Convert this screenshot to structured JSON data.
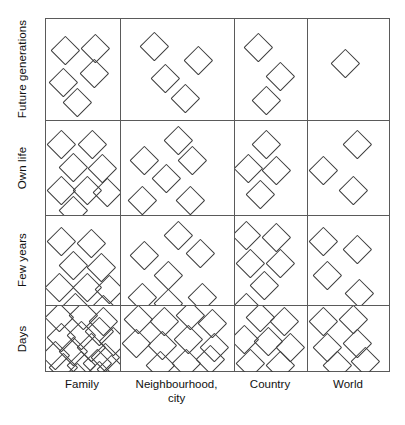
{
  "figure": {
    "type": "matrix-dot-density",
    "row_axis_title": "",
    "col_axis_title": ""
  },
  "rows": [
    {
      "key": "future_generations",
      "label": "Future generations"
    },
    {
      "key": "own_life",
      "label": "Own life"
    },
    {
      "key": "few_years",
      "label": "Few years"
    },
    {
      "key": "days",
      "label": "Days"
    }
  ],
  "columns": [
    {
      "key": "family",
      "label_line1": "Family",
      "label_line2": ""
    },
    {
      "key": "neighbourhood_city",
      "label_line1": "Neighbourhood,",
      "label_line2": "city"
    },
    {
      "key": "country",
      "label_line1": "Country",
      "label_line2": ""
    },
    {
      "key": "world",
      "label_line1": "World",
      "label_line2": ""
    }
  ],
  "chart_data": {
    "type": "heatmap",
    "title": "",
    "xlabel": "",
    "ylabel": "",
    "categories_x": [
      "Family",
      "Neighbourhood, city",
      "Country",
      "World"
    ],
    "categories_y": [
      "Future generations",
      "Own life",
      "Few years",
      "Days"
    ],
    "marker": "diamond-outline",
    "value_meaning": "number of diamond markers drawn in cell",
    "values": [
      {
        "row": "Future generations",
        "col": "Family",
        "count": 5
      },
      {
        "row": "Future generations",
        "col": "Neighbourhood, city",
        "count": 4
      },
      {
        "row": "Future generations",
        "col": "Country",
        "count": 3
      },
      {
        "row": "Future generations",
        "col": "World",
        "count": 1
      },
      {
        "row": "Own life",
        "col": "Family",
        "count": 8
      },
      {
        "row": "Own life",
        "col": "Neighbourhood, city",
        "count": 6
      },
      {
        "row": "Own life",
        "col": "Country",
        "count": 4
      },
      {
        "row": "Own life",
        "col": "World",
        "count": 3
      },
      {
        "row": "Few years",
        "col": "Family",
        "count": 9
      },
      {
        "row": "Few years",
        "col": "Neighbourhood, city",
        "count": 7
      },
      {
        "row": "Few years",
        "col": "Country",
        "count": 6
      },
      {
        "row": "Few years",
        "col": "World",
        "count": 4
      },
      {
        "row": "Days",
        "col": "Family",
        "count": 17
      },
      {
        "row": "Days",
        "col": "Neighbourhood, city",
        "count": 11
      },
      {
        "row": "Days",
        "col": "Country",
        "count": 8
      },
      {
        "row": "Days",
        "col": "World",
        "count": 6
      }
    ],
    "grid": true,
    "legend": "none"
  },
  "geometry": {
    "grid_left": 45,
    "grid_top": 18,
    "grid_width": 345,
    "grid_height": 354,
    "col_edges": [
      0,
      75,
      189,
      262,
      345
    ],
    "row_edges": [
      0,
      102,
      197,
      287,
      354
    ],
    "marker_size": 26,
    "line_color": "#5a5a5a",
    "marker_color": "#3c3c3c",
    "background": "#ffffff"
  },
  "markers": {
    "r0c0": [
      [
        18,
        30
      ],
      [
        48,
        28
      ],
      [
        16,
        62
      ],
      [
        47,
        53
      ],
      [
        30,
        82
      ]
    ],
    "r0c1": [
      [
        32,
        26
      ],
      [
        76,
        40
      ],
      [
        43,
        58
      ],
      [
        63,
        78
      ]
    ],
    "r0c2": [
      [
        22,
        27
      ],
      [
        44,
        56
      ],
      [
        30,
        80
      ]
    ],
    "r0c3": [
      [
        36,
        43
      ]
    ],
    "r1c0": [
      [
        14,
        22
      ],
      [
        45,
        22
      ],
      [
        26,
        45
      ],
      [
        55,
        46
      ],
      [
        14,
        68
      ],
      [
        40,
        68
      ],
      [
        60,
        70
      ],
      [
        26,
        88
      ]
    ],
    "r1c1": [
      [
        56,
        18
      ],
      [
        22,
        38
      ],
      [
        70,
        38
      ],
      [
        44,
        56
      ],
      [
        20,
        78
      ],
      [
        68,
        78
      ]
    ],
    "r1c2": [
      [
        30,
        22
      ],
      [
        12,
        46
      ],
      [
        40,
        48
      ],
      [
        24,
        72
      ]
    ],
    "r1c3": [
      [
        48,
        22
      ],
      [
        14,
        48
      ],
      [
        44,
        68
      ]
    ],
    "r2c0": [
      [
        14,
        24
      ],
      [
        44,
        26
      ],
      [
        26,
        48
      ],
      [
        54,
        50
      ],
      [
        12,
        70
      ],
      [
        40,
        70
      ],
      [
        62,
        72
      ],
      [
        28,
        90
      ],
      [
        56,
        92
      ]
    ],
    "r2c1": [
      [
        56,
        18
      ],
      [
        22,
        38
      ],
      [
        78,
        36
      ],
      [
        46,
        58
      ],
      [
        20,
        80
      ],
      [
        46,
        86
      ],
      [
        80,
        80
      ]
    ],
    "r2c2": [
      [
        10,
        18
      ],
      [
        40,
        20
      ],
      [
        14,
        46
      ],
      [
        44,
        46
      ],
      [
        28,
        68
      ],
      [
        10,
        90
      ]
    ],
    "r2c3": [
      [
        14,
        24
      ],
      [
        48,
        32
      ],
      [
        18,
        58
      ],
      [
        50,
        76
      ]
    ],
    "r3c0": [
      [
        12,
        10
      ],
      [
        36,
        8
      ],
      [
        56,
        14
      ],
      [
        14,
        30
      ],
      [
        34,
        28
      ],
      [
        52,
        24
      ],
      [
        66,
        34
      ],
      [
        8,
        48
      ],
      [
        26,
        44
      ],
      [
        44,
        40
      ],
      [
        58,
        50
      ],
      [
        16,
        60
      ],
      [
        34,
        58
      ],
      [
        50,
        56
      ],
      [
        64,
        62
      ],
      [
        30,
        70
      ],
      [
        52,
        68
      ]
    ],
    "r3c1": [
      [
        16,
        12
      ],
      [
        42,
        14
      ],
      [
        68,
        8
      ],
      [
        90,
        16
      ],
      [
        14,
        36
      ],
      [
        40,
        38
      ],
      [
        66,
        32
      ],
      [
        92,
        40
      ],
      [
        38,
        58
      ],
      [
        64,
        56
      ],
      [
        88,
        52
      ]
    ],
    "r3c2": [
      [
        24,
        10
      ],
      [
        48,
        14
      ],
      [
        8,
        32
      ],
      [
        32,
        34
      ],
      [
        54,
        40
      ],
      [
        14,
        56
      ],
      [
        44,
        58
      ]
    ],
    "r3c3": [
      [
        14,
        14
      ],
      [
        44,
        12
      ],
      [
        18,
        40
      ],
      [
        48,
        36
      ],
      [
        28,
        58
      ],
      [
        56,
        54
      ]
    ]
  }
}
